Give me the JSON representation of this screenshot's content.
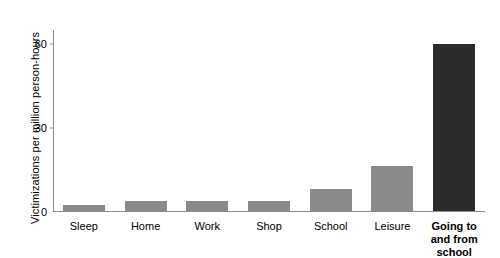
{
  "chart_data": {
    "type": "bar",
    "title": "",
    "xlabel": "",
    "ylabel": "Victimizations per million person-hours",
    "categories": [
      "Sleep",
      "Home",
      "Work",
      "Shop",
      "School",
      "Leisure",
      "Going to and from school"
    ],
    "values": [
      2,
      3.5,
      3.5,
      3.5,
      8,
      16,
      60
    ],
    "ylim": [
      0,
      65
    ],
    "yticks": [
      0,
      30,
      60
    ],
    "ytick_labels": [
      "0",
      "30",
      "60"
    ],
    "grid": false,
    "legend": null,
    "bar_color": "#8a8a8a",
    "highlight_color": "#2b2b2b",
    "highlight_index": 6,
    "axis_color": "#8d8d8d"
  }
}
